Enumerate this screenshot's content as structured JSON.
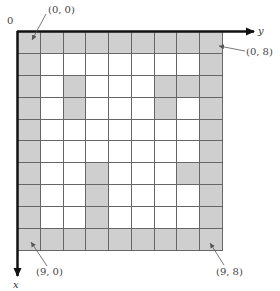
{
  "diagram": {
    "rows": 10,
    "cols": 9,
    "colors": {
      "filled": "#cfcfcf",
      "empty": "#ffffff",
      "line": "#666666",
      "axis": "#111111"
    },
    "grid": [
      [
        1,
        1,
        1,
        1,
        1,
        1,
        1,
        1,
        1
      ],
      [
        1,
        0,
        0,
        0,
        0,
        0,
        0,
        0,
        1
      ],
      [
        1,
        0,
        1,
        0,
        0,
        0,
        1,
        1,
        1
      ],
      [
        1,
        0,
        1,
        0,
        0,
        0,
        1,
        0,
        1
      ],
      [
        1,
        0,
        0,
        0,
        0,
        0,
        0,
        0,
        1
      ],
      [
        1,
        0,
        0,
        0,
        0,
        0,
        0,
        0,
        1
      ],
      [
        1,
        0,
        0,
        1,
        0,
        0,
        0,
        1,
        1
      ],
      [
        1,
        0,
        0,
        1,
        0,
        0,
        0,
        0,
        1
      ],
      [
        1,
        0,
        0,
        1,
        0,
        0,
        0,
        0,
        1
      ],
      [
        1,
        1,
        1,
        1,
        1,
        1,
        1,
        1,
        1
      ]
    ],
    "origin_label": "0",
    "x_axis_label": "x",
    "y_axis_label": "y",
    "annotations": {
      "top_left": "(0, 0)",
      "top_right": "(0, 8)",
      "bottom_left": "(9, 0)",
      "bottom_right": "(9, 8)"
    }
  }
}
